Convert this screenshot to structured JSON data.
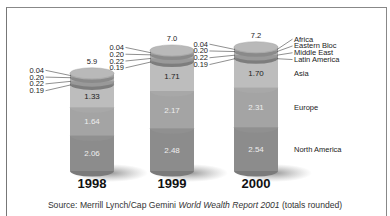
{
  "chart_data": {
    "type": "bar",
    "subtype": "stacked-cylinder",
    "title": "",
    "xlabel": "",
    "ylabel": "",
    "grid": false,
    "legend_position": "right (inline labels beside 2000 column)",
    "categories": [
      "1998",
      "1999",
      "2000"
    ],
    "totals": [
      "5.9",
      "7.0",
      "7.2"
    ],
    "series": [
      {
        "name": "North America",
        "values": [
          2.06,
          2.48,
          2.54
        ],
        "color": "#8a8a8a"
      },
      {
        "name": "Europe",
        "values": [
          1.64,
          2.17,
          2.31
        ],
        "color": "#a2a2a2"
      },
      {
        "name": "Asia",
        "values": [
          1.33,
          1.71,
          1.7
        ],
        "color": "#bcbcbc"
      },
      {
        "name": "Latin America",
        "values": [
          0.19,
          0.19,
          0.19
        ],
        "color": "#9a9a9a"
      },
      {
        "name": "Middle East",
        "values": [
          0.22,
          0.22,
          0.22
        ],
        "color": "#b4b4b4"
      },
      {
        "name": "Eastern Bloc",
        "values": [
          0.2,
          0.2,
          0.2
        ],
        "color": "#a6a6a6"
      },
      {
        "name": "Africa",
        "values": [
          0.04,
          0.04,
          0.04
        ],
        "color": "#c8c8c8"
      }
    ],
    "value_labels": {
      "1998": {
        "small": [
          "0.04",
          "0.20",
          "0.22",
          "0.19"
        ],
        "asia": "1.33",
        "europe": "1.64",
        "north_america": "2.06"
      },
      "1999": {
        "small": [
          "0.04",
          "0.20",
          "0.22",
          "0.19"
        ],
        "asia": "1.71",
        "europe": "2.17",
        "north_america": "2.48"
      },
      "2000": {
        "small": [
          "0.04",
          "0.20",
          "0.22",
          "0.19"
        ],
        "asia": "1.70",
        "europe": "2.31",
        "north_america": "2.54"
      }
    },
    "legend": [
      "Africa",
      "Eastern Bloc",
      "Middle East",
      "Latin America",
      "Asia",
      "Europe",
      "North America"
    ]
  },
  "labels": {
    "source_prefix": "Source: Merrill Lynch/Cap Gemini ",
    "source_title": "World Wealth Report 2001",
    "source_suffix": " (totals rounded)"
  }
}
